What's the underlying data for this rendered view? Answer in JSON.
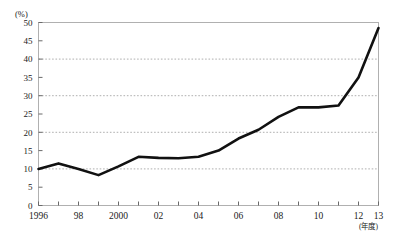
{
  "chart_data": {
    "type": "line",
    "title": "",
    "subtitle": "",
    "xlabel": "(年度)",
    "ylabel": "(%)",
    "xlim": [
      1996,
      2013
    ],
    "ylim": [
      0,
      50
    ],
    "grid": true,
    "grid_values": [
      10,
      20,
      30,
      40
    ],
    "legend": false,
    "legend_position": "none",
    "y_ticks": [
      0,
      5,
      10,
      15,
      20,
      25,
      30,
      35,
      40,
      45,
      50
    ],
    "y_tick_labels": [
      "0",
      "5",
      "10",
      "15",
      "20",
      "25",
      "30",
      "35",
      "40",
      "45",
      "50"
    ],
    "x_ticks": [
      1996,
      1997,
      1998,
      1999,
      2000,
      2001,
      2002,
      2003,
      2004,
      2005,
      2006,
      2007,
      2008,
      2009,
      2010,
      2011,
      2012,
      2013
    ],
    "x_tick_labels": [
      {
        "x": 1996,
        "label": "1996"
      },
      {
        "x": 1998,
        "label": "98"
      },
      {
        "x": 2000,
        "label": "2000"
      },
      {
        "x": 2002,
        "label": "02"
      },
      {
        "x": 2004,
        "label": "04"
      },
      {
        "x": 2006,
        "label": "06"
      },
      {
        "x": 2008,
        "label": "08"
      },
      {
        "x": 2010,
        "label": "10"
      },
      {
        "x": 2012,
        "label": "12"
      },
      {
        "x": 2013,
        "label": "13"
      }
    ],
    "series": [
      {
        "name": "",
        "color": "#111111",
        "x": [
          1996,
          1997,
          1998,
          1999,
          2000,
          2001,
          2002,
          2003,
          2004,
          2005,
          2006,
          2007,
          2008,
          2009,
          2010,
          2011,
          2012,
          2013
        ],
        "values": [
          10.0,
          11.5,
          10.0,
          8.3,
          10.7,
          13.3,
          13.0,
          12.9,
          13.3,
          15.0,
          18.3,
          20.7,
          24.2,
          26.8,
          26.8,
          27.3,
          35.0,
          48.5
        ]
      }
    ]
  },
  "colors": {
    "line": "#111111",
    "grid": "#9a9a9a",
    "frame": "#b0b0b0",
    "axis": "#6a6a6a",
    "text": "#1a1a1a",
    "background": "#ffffff"
  }
}
